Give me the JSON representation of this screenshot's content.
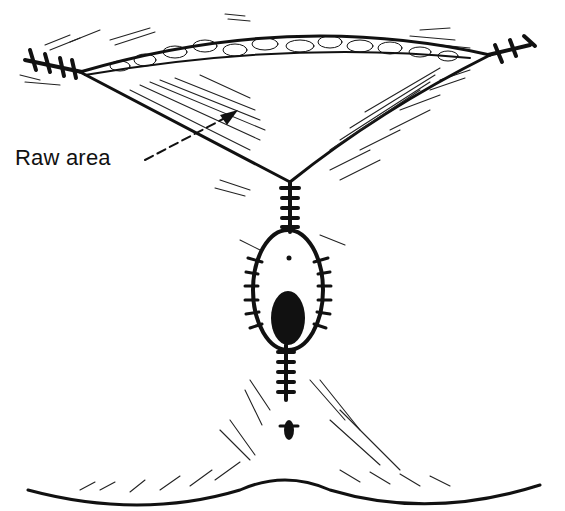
{
  "figure": {
    "type": "surgical line illustration",
    "labels": [
      {
        "text": "Raw area",
        "points_to": "raw tissue region under skin flap"
      }
    ],
    "elements": [
      "skin-flap",
      "raw-area",
      "sutured-incision",
      "ellipse-sutures",
      "umbilicus-opening",
      "base-contour"
    ],
    "colors": {
      "ink": "#111111",
      "background": "#ffffff"
    }
  }
}
